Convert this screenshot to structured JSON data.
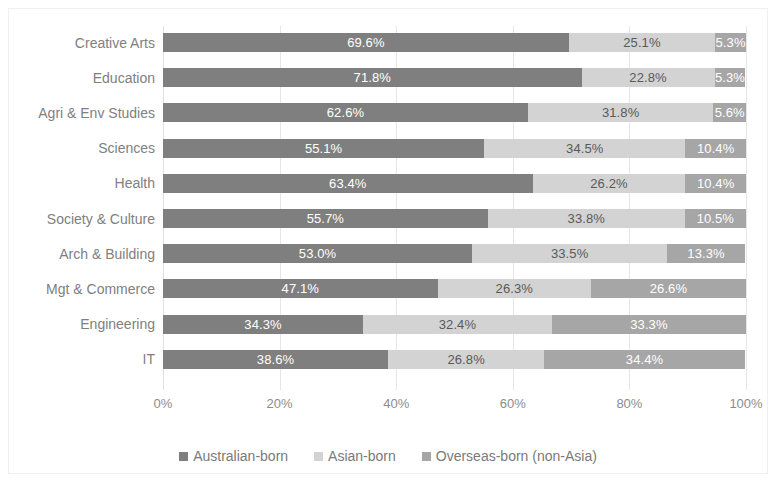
{
  "chart_data": {
    "type": "bar",
    "subtype": "stacked-bar-horizontal-100pct",
    "title": "",
    "xlabel": "",
    "ylabel": "",
    "xlim": [
      0,
      100
    ],
    "xticks": [
      "0%",
      "20%",
      "40%",
      "60%",
      "80%",
      "100%"
    ],
    "xtick_values": [
      0,
      20,
      40,
      60,
      80,
      100
    ],
    "grid": true,
    "grid_axis": "x",
    "legend_position": "bottom",
    "orientation": "horizontal",
    "categories": [
      "Creative Arts",
      "Education",
      "Agri & Env Studies",
      "Sciences",
      "Health",
      "Society & Culture",
      "Arch & Building",
      "Mgt & Commerce",
      "Engineering",
      "IT"
    ],
    "series": [
      {
        "name": "Australian-born",
        "color": "#7f7f7f",
        "values": [
          69.6,
          71.8,
          62.6,
          55.1,
          63.4,
          55.7,
          53.0,
          47.1,
          34.3,
          38.6
        ],
        "labels": [
          "69.6%",
          "71.8%",
          "62.6%",
          "55.1%",
          "63.4%",
          "55.7%",
          "53.0%",
          "47.1%",
          "34.3%",
          "38.6%"
        ]
      },
      {
        "name": "Asian-born",
        "color": "#d3d3d3",
        "values": [
          25.1,
          22.8,
          31.8,
          34.5,
          26.2,
          33.8,
          33.5,
          26.3,
          32.4,
          26.8
        ],
        "labels": [
          "25.1%",
          "22.8%",
          "31.8%",
          "34.5%",
          "26.2%",
          "33.8%",
          "33.5%",
          "26.3%",
          "32.4%",
          "26.8%"
        ]
      },
      {
        "name": "Overseas-born (non-Asia)",
        "color": "#a6a6a6",
        "values": [
          5.3,
          5.3,
          5.6,
          10.4,
          10.4,
          10.5,
          13.3,
          26.6,
          33.3,
          34.4
        ],
        "labels": [
          "5.3%",
          "5.3%",
          "5.6%",
          "10.4%",
          "10.4%",
          "10.5%",
          "13.3%",
          "26.6%",
          "33.3%",
          "34.4%"
        ]
      }
    ],
    "legend": [
      {
        "label": "Australian-born",
        "color": "#7f7f7f"
      },
      {
        "label": "Asian-born",
        "color": "#d3d3d3"
      },
      {
        "label": "Overseas-born (non-Asia)",
        "color": "#a6a6a6"
      }
    ]
  }
}
